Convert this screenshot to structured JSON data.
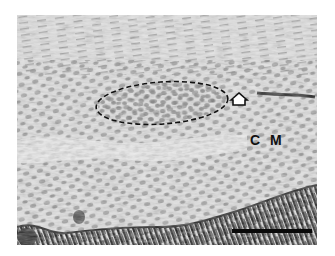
{
  "figure": {
    "type": "grayscale histology micrograph",
    "annotations": {
      "region_label": "C M",
      "outlined_region": "dashed ellipse",
      "arrow": "open arrowhead pointing left",
      "scale_bar": "black scale bar, bottom right"
    },
    "colors": {
      "background": "#ffffff",
      "tissue_light": "#e4e4e4",
      "nuclei": "#8a8a8a",
      "epithelium_dark": "#1c1c1c",
      "annotation": "#111111"
    }
  }
}
